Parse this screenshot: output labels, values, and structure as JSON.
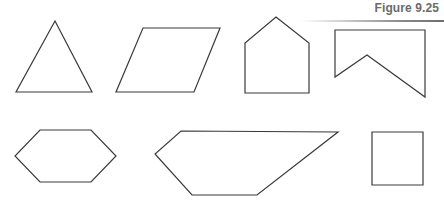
{
  "figure": {
    "label": "Figure 9.25"
  },
  "shapes": [
    {
      "name": "triangle",
      "points": "55,21 92,92 16,92"
    },
    {
      "name": "parallelogram",
      "points": "143,28 220,28 194,92 116,92"
    },
    {
      "name": "pentagon-house",
      "points": "276,17 309,43 309,93 245,93 245,43"
    },
    {
      "name": "concave-pentagon",
      "points": "335,30 425,30 425,97 367,55 335,77"
    },
    {
      "name": "hexagon",
      "points": "40,130 91,130 116,156 91,182 40,182 15,156"
    },
    {
      "name": "irregular-pentagon",
      "points": "181,131 338,132 257,195 192,195 155,154"
    },
    {
      "name": "square",
      "points": "372,132 423,132 423,185 372,185"
    }
  ]
}
